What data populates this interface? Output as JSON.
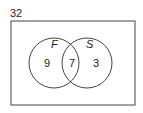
{
  "venn": {
    "universal_total": "32",
    "sets": [
      {
        "label": "F",
        "only_count": "9"
      },
      {
        "label": "S",
        "only_count": "3"
      }
    ],
    "intersection_count": "7"
  }
}
